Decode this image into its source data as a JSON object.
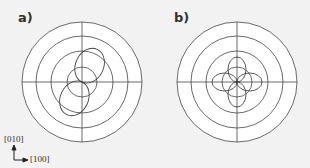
{
  "panels": [
    {
      "label": "a)",
      "center": [
        82,
        82
      ],
      "grid_radii": [
        60,
        46,
        31,
        15
      ],
      "pattern": "two-lobe",
      "lobe_tilt_deg": 25,
      "lobe_length": 36,
      "lobe_width": 14
    },
    {
      "label": "b)",
      "center": [
        237,
        82
      ],
      "grid_radii": [
        60,
        46,
        31,
        15
      ],
      "pattern": "four-lobe",
      "lobe_length": 25,
      "lobe_width": 9
    }
  ],
  "axes": {
    "vertical_label": "[010]",
    "horizontal_label": "[100]"
  },
  "colors": {
    "background": "#f2f2f2",
    "disc": "#ffffff",
    "line": "#444444"
  }
}
